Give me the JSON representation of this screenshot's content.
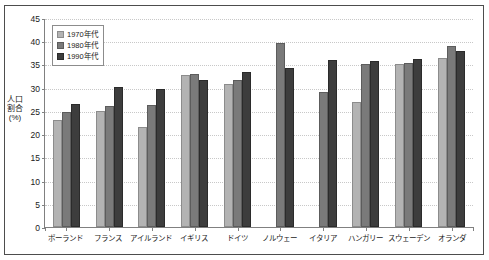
{
  "chart_data": {
    "type": "bar",
    "title": "",
    "xlabel": "",
    "ylabel": "人口割合(%)",
    "ylim": [
      0,
      45
    ],
    "ytick_step": 5,
    "yticks": [
      45,
      40,
      35,
      30,
      25,
      20,
      15,
      10,
      5,
      0
    ],
    "grid": true,
    "legend_position": "top-left",
    "categories": [
      "ポーランド",
      "フランス",
      "アイルランド",
      "イギリス",
      "ドイツ",
      "ノルウェー",
      "イタリア",
      "ハンガリー",
      "スウェーデン",
      "オランダ"
    ],
    "series": [
      {
        "name": "1970年代",
        "color": "#b3b3b3",
        "values": [
          23.0,
          25.0,
          21.5,
          32.7,
          30.8,
          null,
          null,
          27.0,
          35.0,
          36.4
        ]
      },
      {
        "name": "1980年代",
        "color": "#7a7a7a",
        "values": [
          24.8,
          26.0,
          26.3,
          33.0,
          31.7,
          39.6,
          29.1,
          35.2,
          35.3,
          39.0
        ]
      },
      {
        "name": "1990年代",
        "color": "#3d3d3d",
        "values": [
          26.4,
          30.1,
          29.8,
          31.7,
          33.3,
          34.2,
          36.0,
          35.8,
          36.2,
          37.8
        ]
      }
    ]
  },
  "legend": {
    "items": [
      {
        "label": "1970年代"
      },
      {
        "label": "1980年代"
      },
      {
        "label": "1990年代"
      }
    ]
  }
}
